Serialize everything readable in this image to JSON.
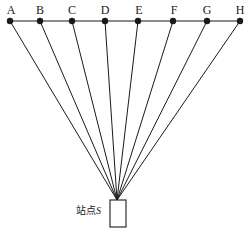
{
  "figure": {
    "canvas": {
      "width": 249,
      "height": 234,
      "background": "#ffffff"
    },
    "stroke_color": "#1a1a1a",
    "baseline": {
      "name": "horizontal-baseline",
      "y": 21,
      "x_start": 9,
      "x_end": 241
    },
    "station": {
      "label_prefix": "站点",
      "label_letter": "S",
      "full_label": "站点S",
      "apex": {
        "x": 117,
        "y": 200
      },
      "box": {
        "x": 110,
        "y": 200,
        "width": 16,
        "height": 27
      },
      "label_position": {
        "x": 76,
        "y": 206
      }
    },
    "points": [
      {
        "id": "A",
        "label": "A",
        "x": 10,
        "y": 21,
        "label_x": 4,
        "label_y": 4
      },
      {
        "id": "B",
        "label": "B",
        "x": 40,
        "y": 21,
        "label_x": 33,
        "label_y": 4
      },
      {
        "id": "C",
        "label": "C",
        "x": 72,
        "y": 21,
        "label_x": 65,
        "label_y": 4
      },
      {
        "id": "D",
        "label": "D",
        "x": 105,
        "y": 21,
        "label_x": 98,
        "label_y": 4
      },
      {
        "id": "E",
        "label": "E",
        "x": 138,
        "y": 21,
        "label_x": 132,
        "label_y": 4
      },
      {
        "id": "F",
        "label": "F",
        "x": 173,
        "y": 21,
        "label_x": 167,
        "label_y": 4
      },
      {
        "id": "G",
        "label": "G",
        "x": 207,
        "y": 21,
        "label_x": 200,
        "label_y": 4
      },
      {
        "id": "H",
        "label": "H",
        "x": 240,
        "y": 21,
        "label_x": 233,
        "label_y": 4
      }
    ],
    "dot_radius": 3.2,
    "line_width": 1
  }
}
